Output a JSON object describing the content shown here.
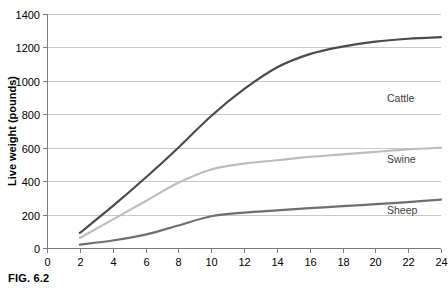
{
  "figure": {
    "caption": "FIG. 6.2"
  },
  "chart_data": {
    "type": "line",
    "title": "",
    "xlabel": "Age (months)",
    "ylabel": "Live weight (pounds)",
    "xlim": [
      0,
      24
    ],
    "ylim": [
      0,
      1400
    ],
    "xticks": [
      0,
      2,
      4,
      6,
      8,
      10,
      12,
      14,
      16,
      18,
      20,
      22,
      24
    ],
    "yticks": [
      0,
      200,
      400,
      600,
      800,
      1000,
      1200,
      1400
    ],
    "xtick_labels": [
      "0",
      "2",
      "4",
      "6",
      "8",
      "10",
      "12",
      "14",
      "16",
      "18",
      "20",
      "22",
      "24"
    ],
    "ytick_labels": [
      "0",
      "200",
      "400",
      "600",
      "800",
      "1000",
      "1200",
      "1400"
    ],
    "grid": "horizontal",
    "legend_position": "inline-right",
    "x": [
      2,
      4,
      6,
      8,
      10,
      12,
      14,
      16,
      18,
      20,
      22,
      24
    ],
    "series": [
      {
        "name": "Cattle",
        "color": "#4b4b4b",
        "width": 2.2,
        "label_y": 900,
        "values": [
          90,
          250,
          420,
          600,
          790,
          950,
          1080,
          1160,
          1205,
          1235,
          1252,
          1262
        ]
      },
      {
        "name": "Swine",
        "color": "#bdbdbd",
        "width": 2.2,
        "label_y": 530,
        "values": [
          60,
          170,
          280,
          390,
          470,
          505,
          525,
          545,
          560,
          575,
          590,
          600
        ]
      },
      {
        "name": "Sheep",
        "color": "#6f6f6f",
        "width": 2.2,
        "label_y": 230,
        "values": [
          20,
          45,
          80,
          135,
          190,
          212,
          225,
          238,
          250,
          262,
          275,
          290
        ]
      }
    ]
  }
}
